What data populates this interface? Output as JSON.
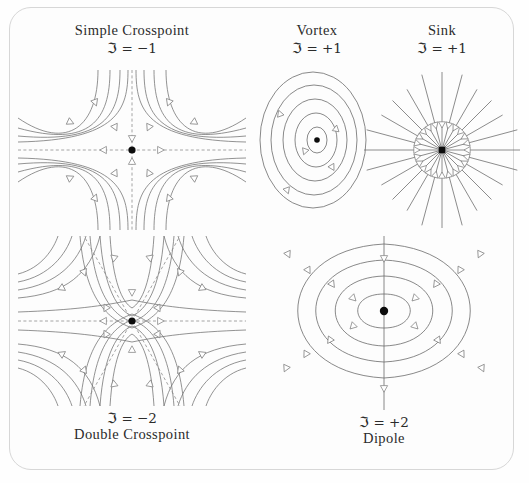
{
  "figure": {
    "background_color": "#fdfdfd",
    "border_color": "#d7d7d7",
    "stroke_color": "#6f6f6f",
    "separatrix_color": "#8d8d8d",
    "arrowhead_fill": "#ffffff",
    "singularity_dot_color": "#0c0c0c"
  },
  "panels": [
    {
      "id": "simple-crosspoint",
      "name": "Simple Crosspoint",
      "index_label": "ℑ = −1",
      "index_value": -1,
      "label_position": "above",
      "topology": "saddle",
      "separatrix_count": 4,
      "streamline_count": 16,
      "arrowheads": 16,
      "has_center_dot": true
    },
    {
      "id": "vortex",
      "name": "Vortex",
      "index_label": "ℑ = +1",
      "index_value": 1,
      "label_position": "above",
      "topology": "center",
      "orbit_count": 5,
      "arrowheads": 4,
      "rotation": "clockwise",
      "has_center_dot": true
    },
    {
      "id": "sink",
      "name": "Sink",
      "index_label": "ℑ = +1",
      "index_value": 1,
      "label_position": "above",
      "topology": "node",
      "ray_count": 24,
      "flow_direction": "inward",
      "has_center_dot": true
    },
    {
      "id": "double-crosspoint",
      "name": "Double Crosspoint",
      "index_label": "ℑ = −2",
      "index_value": -2,
      "label_position": "below",
      "topology": "monkey-saddle",
      "separatrix_count": 6,
      "streamline_count": 24,
      "has_center_dot": true
    },
    {
      "id": "dipole",
      "name": "Dipole",
      "index_label": "ℑ = +2",
      "index_value": 2,
      "label_position": "below",
      "topology": "dipole",
      "loops_per_side": 4,
      "has_axis_line": true,
      "has_center_dot": true
    }
  ],
  "chart_data": {
    "type": "diagram",
    "quantity": "Poincaré index ℑ",
    "categories": [
      "Simple Crosspoint",
      "Vortex",
      "Sink",
      "Double Crosspoint",
      "Dipole"
    ],
    "values": [
      -1,
      1,
      1,
      -2,
      2
    ],
    "labels": [
      "ℑ = −1",
      "ℑ = +1",
      "ℑ = +1",
      "ℑ = −2",
      "ℑ = +2"
    ]
  }
}
